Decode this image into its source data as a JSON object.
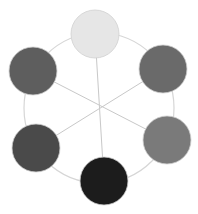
{
  "diagram": {
    "type": "hexagonal-color-wheel",
    "ring": {
      "cx": 99,
      "cy": 108,
      "r": 75,
      "stroke": "#d6d6d6"
    },
    "spokes_stroke": "#c8c8c8",
    "center": {
      "x": 99,
      "y": 108
    },
    "nodes": [
      {
        "id": "top",
        "cx": 95,
        "cy": 34,
        "r": 24,
        "fill": "#e6e6e6"
      },
      {
        "id": "top-right",
        "cx": 163,
        "cy": 69,
        "r": 24,
        "fill": "#6a6a6a"
      },
      {
        "id": "bottom-right",
        "cx": 167,
        "cy": 140,
        "r": 24,
        "fill": "#7a7a7a"
      },
      {
        "id": "bottom",
        "cx": 104,
        "cy": 181,
        "r": 24,
        "fill": "#1c1c1c"
      },
      {
        "id": "bottom-left",
        "cx": 36,
        "cy": 148,
        "r": 24,
        "fill": "#4a4a4a"
      },
      {
        "id": "top-left",
        "cx": 33,
        "cy": 71,
        "r": 24,
        "fill": "#5e5e5e"
      }
    ]
  }
}
